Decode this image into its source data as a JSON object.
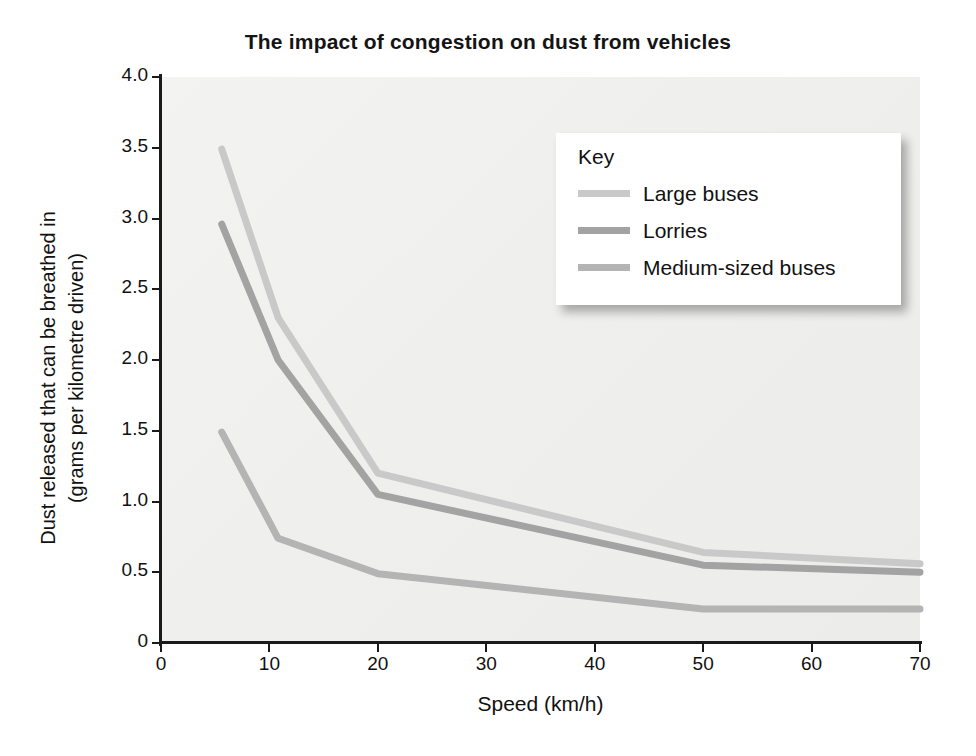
{
  "chart_data": {
    "type": "line",
    "title": "The impact of congestion on dust from vehicles",
    "xlabel": "Speed (km/h)",
    "ylabel": "Dust released that can be breathed in\n(grams per kilometre driven)",
    "xlim": [
      0,
      70
    ],
    "ylim": [
      0,
      4.0
    ],
    "xticks": [
      "0",
      "10",
      "20",
      "30",
      "40",
      "50",
      "60",
      "70"
    ],
    "xtick_values": [
      0,
      10,
      20,
      30,
      40,
      50,
      60,
      70
    ],
    "yticks": [
      "0",
      "0.5",
      "1.0",
      "1.5",
      "2.0",
      "2.5",
      "3.0",
      "3.5",
      "4.0"
    ],
    "ytick_values": [
      0,
      0.5,
      1.0,
      1.5,
      2.0,
      2.5,
      3.0,
      3.5,
      4.0
    ],
    "grid": false,
    "legend_position": "upper right",
    "legend_title": "Key",
    "series": [
      {
        "name": "Large buses",
        "color": "#c9c9c9",
        "x": [
          5.6,
          10.8,
          20.0,
          50.0,
          70.0
        ],
        "y": [
          3.49,
          2.3,
          1.2,
          0.64,
          0.56
        ]
      },
      {
        "name": "Lorries",
        "color": "#a3a3a3",
        "x": [
          5.6,
          10.8,
          20.0,
          50.0,
          70.0
        ],
        "y": [
          2.96,
          2.0,
          1.05,
          0.55,
          0.5
        ]
      },
      {
        "name": "Medium-sized buses",
        "color": "#b4b4b4",
        "x": [
          5.6,
          10.8,
          20.0,
          50.0,
          70.0
        ],
        "y": [
          1.49,
          0.74,
          0.49,
          0.24,
          0.24
        ]
      }
    ]
  },
  "style": {
    "plot_background": "#f1f1ef",
    "axis_color": "#1a1a1a",
    "text_color": "#111111",
    "page_background": "#ffffff"
  }
}
